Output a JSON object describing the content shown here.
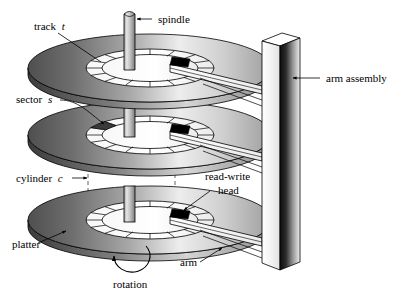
{
  "figure": {
    "background_color": "#ffffff",
    "line_color": "#000000"
  },
  "labels": {
    "track": {
      "text": "track",
      "variable": "t"
    },
    "spindle": {
      "text": "spindle"
    },
    "arm_assembly": {
      "text": "arm assembly"
    },
    "sector": {
      "text": "sector",
      "variable": "s"
    },
    "cylinder": {
      "text": "cylinder",
      "variable": "c"
    },
    "read_write_head_line1": {
      "text": "read-write"
    },
    "read_write_head_line2": {
      "text": "head"
    },
    "platter": {
      "text": "platter"
    },
    "arm": {
      "text": "arm"
    },
    "rotation": {
      "text": "rotation"
    }
  },
  "components": {
    "platter_count": 3,
    "sectors_per_track": 16,
    "platters": [
      {
        "name": "top-platter",
        "center_x": 150,
        "center_y": 68
      },
      {
        "name": "middle-platter",
        "center_x": 150,
        "center_y": 135
      },
      {
        "name": "bottom-platter",
        "center_x": 150,
        "center_y": 220
      }
    ],
    "spindle": {
      "name": "spindle-shaft",
      "top_y": 10,
      "bottom_y": 250
    },
    "arm_assembly": {
      "name": "arm-assembly-column",
      "x": 262,
      "top_y": 33,
      "bottom_y": 270
    },
    "heads": [
      {
        "name": "head-top"
      },
      {
        "name": "head-middle"
      },
      {
        "name": "head-bottom"
      }
    ],
    "cylinder_guides": [
      {
        "name": "cylinder-dashed-left",
        "x": 88
      },
      {
        "name": "cylinder-dashed-right",
        "x": 175
      }
    ]
  },
  "colors": {
    "platter_dark": "#585858",
    "platter_mid": "#9a9a9a",
    "platter_light": "#f2f2f2",
    "spindle_light": "#d8d8d8",
    "spindle_dark": "#8a8a8a",
    "column_dark": "#1a1a1a",
    "column_light": "#ffffff",
    "head_fill": "#000000",
    "outline": "#000000"
  }
}
